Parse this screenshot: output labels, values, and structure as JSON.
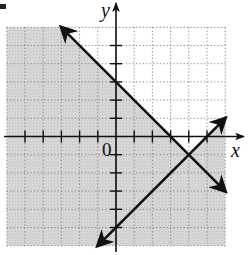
{
  "chart_data": {
    "type": "line",
    "title": "",
    "xlabel": "x",
    "ylabel": "y",
    "origin_label": "0",
    "xlim": [
      -6,
      6
    ],
    "ylim": [
      -6,
      6
    ],
    "grid": true,
    "grid_style": "dotted",
    "tick_spacing": 1,
    "series": [
      {
        "name": "boundary-1",
        "equation": "y = -x + 3",
        "slope": -1,
        "intercept": 3,
        "points": [
          [
            -3,
            6
          ],
          [
            6,
            -3
          ]
        ],
        "style": "solid",
        "arrows": "both"
      },
      {
        "name": "boundary-2",
        "equation": "y = x - 5",
        "slope": 1,
        "intercept": -5,
        "points": [
          [
            -1,
            -6
          ],
          [
            6,
            1
          ]
        ],
        "style": "solid",
        "arrows": "both"
      }
    ],
    "intersection": [
      4,
      -1
    ],
    "shaded_region": "y <= -x + 3 or y <= x - 5",
    "unshaded_region": "y > -x + 3 and y > x - 5",
    "colors": {
      "shade": "#d4d4d4",
      "line": "#111111",
      "grid": "#888888",
      "background": "#ffffff"
    }
  }
}
